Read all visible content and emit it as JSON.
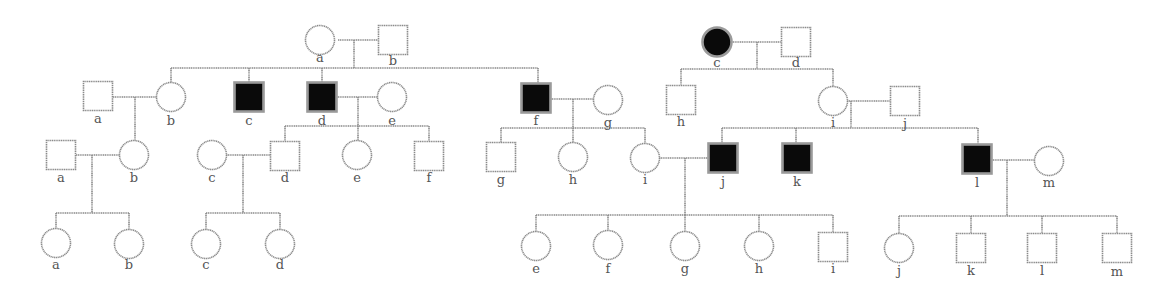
{
  "diagram": {
    "type": "pedigree-chart",
    "colors": {
      "line": "#8a8a8a",
      "affected_fill": "#0a0a0a",
      "unaffected_fill": "#ffffff",
      "label": "#555555"
    },
    "lines": [
      [
        338,
        40,
        378,
        40
      ],
      [
        354,
        40,
        354,
        68
      ],
      [
        171,
        68,
        538,
        68
      ],
      [
        171,
        68,
        171,
        83
      ],
      [
        249,
        68,
        249,
        82
      ],
      [
        322,
        68,
        322,
        82
      ],
      [
        538,
        68,
        538,
        84
      ],
      [
        113,
        97,
        157,
        97
      ],
      [
        135,
        97,
        135,
        155
      ],
      [
        336,
        97,
        378,
        97
      ],
      [
        358,
        97,
        358,
        126
      ],
      [
        285,
        126,
        429,
        126
      ],
      [
        285,
        126,
        285,
        141
      ],
      [
        358,
        126,
        358,
        141
      ],
      [
        429,
        126,
        429,
        141
      ],
      [
        76,
        155,
        120,
        155
      ],
      [
        92,
        155,
        92,
        213
      ],
      [
        56,
        213,
        129,
        213
      ],
      [
        56,
        213,
        56,
        229
      ],
      [
        129,
        213,
        129,
        230
      ],
      [
        226,
        155,
        271,
        155
      ],
      [
        243,
        155,
        243,
        213
      ],
      [
        206,
        213,
        280,
        213
      ],
      [
        206,
        213,
        206,
        230
      ],
      [
        280,
        213,
        280,
        230
      ],
      [
        550,
        99,
        594,
        99
      ],
      [
        573,
        99,
        573,
        128
      ],
      [
        501,
        128,
        645,
        128
      ],
      [
        501,
        128,
        501,
        143
      ],
      [
        573,
        128,
        573,
        143
      ],
      [
        645,
        128,
        645,
        144
      ],
      [
        659,
        158,
        709,
        158
      ],
      [
        685,
        158,
        685,
        215
      ],
      [
        536,
        215,
        833,
        215
      ],
      [
        536,
        215,
        536,
        232
      ],
      [
        608,
        215,
        608,
        231
      ],
      [
        685,
        215,
        685,
        232
      ],
      [
        759,
        215,
        759,
        232
      ],
      [
        833,
        215,
        833,
        232
      ],
      [
        731,
        42,
        781,
        42
      ],
      [
        757,
        42,
        757,
        69
      ],
      [
        681,
        69,
        833,
        69
      ],
      [
        681,
        69,
        681,
        85
      ],
      [
        833,
        69,
        833,
        87
      ],
      [
        847,
        101,
        890,
        101
      ],
      [
        851,
        101,
        851,
        128
      ],
      [
        722,
        128,
        978,
        128
      ],
      [
        722,
        128,
        722,
        144
      ],
      [
        796,
        128,
        796,
        144
      ],
      [
        978,
        128,
        978,
        145
      ],
      [
        991,
        160,
        1035,
        160
      ],
      [
        1007,
        160,
        1007,
        216
      ],
      [
        899,
        216,
        1117,
        216
      ],
      [
        899,
        216,
        899,
        234
      ],
      [
        971,
        216,
        971,
        233
      ],
      [
        1042,
        216,
        1042,
        233
      ],
      [
        1117,
        216,
        1117,
        233
      ]
    ],
    "individuals": [
      {
        "id": "I-a-left",
        "label": "a",
        "sex": "female",
        "affected": false,
        "cx": 320,
        "cy": 40,
        "lx": 320,
        "ly": 62
      },
      {
        "id": "I-b-left",
        "label": "b",
        "sex": "male",
        "affected": false,
        "cx": 393,
        "cy": 40,
        "lx": 393,
        "ly": 65
      },
      {
        "id": "II-a",
        "label": "a",
        "sex": "male",
        "affected": false,
        "cx": 98,
        "cy": 96,
        "lx": 98,
        "ly": 123
      },
      {
        "id": "II-b",
        "label": "b",
        "sex": "female",
        "affected": false,
        "cx": 171,
        "cy": 97,
        "lx": 171,
        "ly": 125
      },
      {
        "id": "II-c",
        "label": "c",
        "sex": "male",
        "affected": true,
        "cx": 249,
        "cy": 97,
        "lx": 249,
        "ly": 125
      },
      {
        "id": "II-d",
        "label": "d",
        "sex": "male",
        "affected": true,
        "cx": 322,
        "cy": 97,
        "lx": 322,
        "ly": 125
      },
      {
        "id": "II-e",
        "label": "e",
        "sex": "female",
        "affected": false,
        "cx": 392,
        "cy": 97,
        "lx": 392,
        "ly": 125
      },
      {
        "id": "II-f",
        "label": "f",
        "sex": "male",
        "affected": true,
        "cx": 536,
        "cy": 98,
        "lx": 536,
        "ly": 125
      },
      {
        "id": "II-g",
        "label": "g",
        "sex": "female",
        "affected": false,
        "cx": 608,
        "cy": 100,
        "lx": 608,
        "ly": 127
      },
      {
        "id": "III-a",
        "label": "a",
        "sex": "male",
        "affected": false,
        "cx": 61,
        "cy": 155,
        "lx": 61,
        "ly": 182
      },
      {
        "id": "III-b",
        "label": "b",
        "sex": "female",
        "affected": false,
        "cx": 134,
        "cy": 155,
        "lx": 134,
        "ly": 182
      },
      {
        "id": "III-c",
        "label": "c",
        "sex": "female",
        "affected": false,
        "cx": 212,
        "cy": 155,
        "lx": 212,
        "ly": 182
      },
      {
        "id": "III-d",
        "label": "d",
        "sex": "male",
        "affected": false,
        "cx": 285,
        "cy": 156,
        "lx": 285,
        "ly": 182
      },
      {
        "id": "III-e",
        "label": "e",
        "sex": "female",
        "affected": false,
        "cx": 357,
        "cy": 155,
        "lx": 357,
        "ly": 182
      },
      {
        "id": "III-f",
        "label": "f",
        "sex": "male",
        "affected": false,
        "cx": 429,
        "cy": 156,
        "lx": 429,
        "ly": 182
      },
      {
        "id": "III-g",
        "label": "g",
        "sex": "male",
        "affected": false,
        "cx": 501,
        "cy": 157,
        "lx": 501,
        "ly": 184
      },
      {
        "id": "III-h",
        "label": "h",
        "sex": "female",
        "affected": false,
        "cx": 573,
        "cy": 157,
        "lx": 573,
        "ly": 184
      },
      {
        "id": "III-i",
        "label": "i",
        "sex": "female",
        "affected": false,
        "cx": 645,
        "cy": 158,
        "lx": 645,
        "ly": 184
      },
      {
        "id": "III-j",
        "label": "j",
        "sex": "male",
        "affected": true,
        "cx": 723,
        "cy": 158,
        "lx": 723,
        "ly": 186
      },
      {
        "id": "III-k",
        "label": "k",
        "sex": "male",
        "affected": true,
        "cx": 797,
        "cy": 158,
        "lx": 797,
        "ly": 186
      },
      {
        "id": "III-l",
        "label": "l",
        "sex": "male",
        "affected": true,
        "cx": 977,
        "cy": 159,
        "lx": 977,
        "ly": 187
      },
      {
        "id": "III-m",
        "label": "m",
        "sex": "female",
        "affected": false,
        "cx": 1049,
        "cy": 161,
        "lx": 1049,
        "ly": 187
      },
      {
        "id": "IV-a",
        "label": "a",
        "sex": "female",
        "affected": false,
        "cx": 56,
        "cy": 243,
        "lx": 56,
        "ly": 269
      },
      {
        "id": "IV-b",
        "label": "b",
        "sex": "female",
        "affected": false,
        "cx": 129,
        "cy": 244,
        "lx": 129,
        "ly": 269
      },
      {
        "id": "IV-c",
        "label": "c",
        "sex": "female",
        "affected": false,
        "cx": 206,
        "cy": 244,
        "lx": 206,
        "ly": 269
      },
      {
        "id": "IV-d",
        "label": "d",
        "sex": "female",
        "affected": false,
        "cx": 280,
        "cy": 244,
        "lx": 280,
        "ly": 269
      },
      {
        "id": "IV-e",
        "label": "e",
        "sex": "female",
        "affected": false,
        "cx": 536,
        "cy": 246,
        "lx": 536,
        "ly": 273
      },
      {
        "id": "IV-f",
        "label": "f",
        "sex": "female",
        "affected": false,
        "cx": 608,
        "cy": 245,
        "lx": 608,
        "ly": 273
      },
      {
        "id": "IV-g",
        "label": "g",
        "sex": "female",
        "affected": false,
        "cx": 685,
        "cy": 246,
        "lx": 685,
        "ly": 273
      },
      {
        "id": "IV-h",
        "label": "h",
        "sex": "female",
        "affected": false,
        "cx": 759,
        "cy": 246,
        "lx": 759,
        "ly": 273
      },
      {
        "id": "IV-i",
        "label": "i",
        "sex": "male",
        "affected": false,
        "cx": 833,
        "cy": 247,
        "lx": 833,
        "ly": 273
      },
      {
        "id": "I-c-right",
        "label": "c",
        "sex": "female",
        "affected": true,
        "cx": 717,
        "cy": 42,
        "lx": 717,
        "ly": 67
      },
      {
        "id": "I-d-right",
        "label": "d",
        "sex": "male",
        "affected": false,
        "cx": 796,
        "cy": 42,
        "lx": 796,
        "ly": 67
      },
      {
        "id": "II-h-right",
        "label": "h",
        "sex": "male",
        "affected": false,
        "cx": 681,
        "cy": 100,
        "lx": 681,
        "ly": 126
      },
      {
        "id": "II-i-right",
        "label": "i",
        "sex": "female",
        "affected": false,
        "cx": 833,
        "cy": 101,
        "lx": 833,
        "ly": 127
      },
      {
        "id": "II-j-right",
        "label": "j",
        "sex": "male",
        "affected": false,
        "cx": 905,
        "cy": 101,
        "lx": 905,
        "ly": 128
      },
      {
        "id": "IV-j",
        "label": "j",
        "sex": "female",
        "affected": false,
        "cx": 899,
        "cy": 248,
        "lx": 899,
        "ly": 275
      },
      {
        "id": "IV-k",
        "label": "k",
        "sex": "male",
        "affected": false,
        "cx": 971,
        "cy": 248,
        "lx": 971,
        "ly": 275
      },
      {
        "id": "IV-l",
        "label": "l",
        "sex": "male",
        "affected": false,
        "cx": 1042,
        "cy": 248,
        "lx": 1042,
        "ly": 275
      },
      {
        "id": "IV-m",
        "label": "m",
        "sex": "male",
        "affected": false,
        "cx": 1117,
        "cy": 248,
        "lx": 1117,
        "ly": 276
      }
    ]
  }
}
